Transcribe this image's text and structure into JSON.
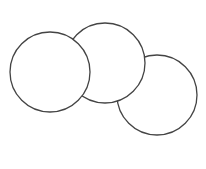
{
  "diagram": {
    "stroke_color": "#444444",
    "fill_color": "#ffffff",
    "circles": [
      {
        "name": "right-circle",
        "cx": 157,
        "cy": 95,
        "r": 40
      },
      {
        "name": "middle-circle",
        "cx": 105,
        "cy": 63,
        "r": 40
      },
      {
        "name": "left-circle",
        "cx": 50,
        "cy": 72,
        "r": 40
      }
    ]
  }
}
